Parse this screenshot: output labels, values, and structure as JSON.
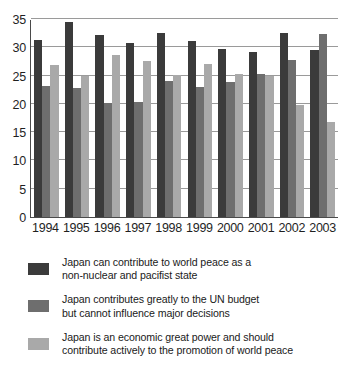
{
  "chart_data": {
    "type": "bar",
    "title": "",
    "subtitle": "",
    "xlabel": "",
    "ylabel": "",
    "categories": [
      "1994",
      "1995",
      "1996",
      "1997",
      "1998",
      "1999",
      "2000",
      "2001",
      "2002",
      "2003"
    ],
    "ylim": [
      0,
      35
    ],
    "yticks": [
      0,
      5,
      10,
      15,
      20,
      25,
      30,
      35
    ],
    "ytick_labels": [
      "0",
      "5",
      "10",
      "15",
      "20",
      "25",
      "30",
      "35"
    ],
    "grid": true,
    "legend_position": "below",
    "series": [
      {
        "name": "Japan can contribute to world peace as a non-nuclear and pacifist state",
        "color": "#3b3b3b",
        "values": [
          31.3,
          34.5,
          32.1,
          30.7,
          32.6,
          31.1,
          29.7,
          29.2,
          32.6,
          29.5
        ]
      },
      {
        "name": "Japan contributes greatly to the UN budget but cannot influence major decisions",
        "color": "#6e6e6e",
        "values": [
          23.2,
          22.8,
          20.2,
          20.3,
          24.0,
          23.0,
          23.9,
          25.2,
          27.7,
          32.3
        ]
      },
      {
        "name": "Japan is an economic great power and should contribute actively to the promotion of world peace",
        "color": "#a9a9a9",
        "values": [
          26.8,
          25.0,
          28.7,
          27.5,
          25.1,
          27.0,
          25.2,
          24.9,
          19.8,
          16.8
        ]
      }
    ]
  },
  "legend": {
    "items": [
      {
        "swatch": "s0",
        "line1": "Japan can contribute to world peace as a",
        "line2": "non-nuclear and pacifist state"
      },
      {
        "swatch": "s1",
        "line1": "Japan contributes greatly to the UN budget",
        "line2": "but cannot influence major decisions"
      },
      {
        "swatch": "s2",
        "line1": "Japan is an economic great power and should",
        "line2": "contribute actively to the promotion of world peace"
      }
    ]
  }
}
